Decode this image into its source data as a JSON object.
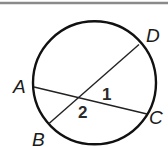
{
  "diagram": {
    "type": "circle-with-intersecting-chords",
    "colors": {
      "top_rule": "#8a8a8a",
      "circle": "#111111",
      "chord": "#222222",
      "text": "#1a1a1a"
    },
    "points": {
      "A": {
        "label": "A"
      },
      "B": {
        "label": "B"
      },
      "C": {
        "label": "C"
      },
      "D": {
        "label": "D"
      }
    },
    "chords": [
      {
        "name": "AC",
        "from": "A",
        "to": "C"
      },
      {
        "name": "BD",
        "from": "B",
        "to": "D"
      }
    ],
    "angles": [
      {
        "label": "1"
      },
      {
        "label": "2"
      }
    ]
  }
}
